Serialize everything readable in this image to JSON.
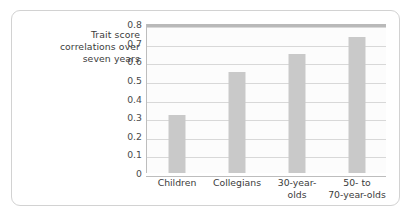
{
  "axis_title": {
    "lines": [
      "Trait score",
      "correlations over",
      "seven years"
    ]
  },
  "colors": {
    "bar": "#c9c9c9",
    "gridline": "#d8d8d8",
    "plot_background": "#fcfcfc",
    "card_border": "#d2d2d2",
    "text": "#3b3b3b"
  },
  "chart_data": {
    "type": "bar",
    "title": "",
    "xlabel": "",
    "ylabel": "Trait score correlations over seven years",
    "categories": [
      "Children",
      "Collegians",
      "30-year-olds",
      "50- to 70-year-olds"
    ],
    "category_label_lines": [
      [
        "Children"
      ],
      [
        "Collegians"
      ],
      [
        "30-year-",
        "olds"
      ],
      [
        "50-  to",
        "70-year-olds"
      ]
    ],
    "values": [
      0.31,
      0.54,
      0.64,
      0.73
    ],
    "ylim": [
      0,
      0.8
    ],
    "yticks": [
      "0",
      "0.1",
      "0.2",
      "0.3",
      "0.4",
      "0.5",
      "0.6",
      "0.7",
      "0.8"
    ],
    "ytick_values": [
      0,
      0.1,
      0.2,
      0.3,
      0.4,
      0.5,
      0.6,
      0.7,
      0.8
    ],
    "grid": true,
    "legend": false
  }
}
